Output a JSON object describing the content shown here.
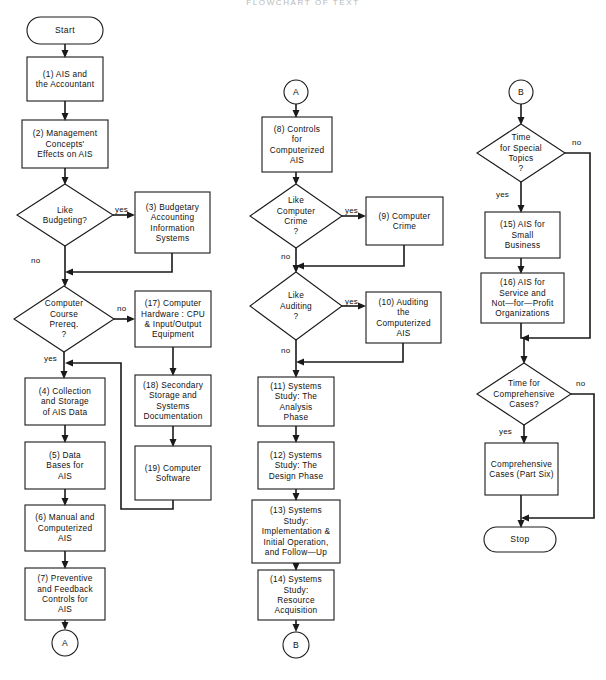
{
  "document": {
    "title_faint": "FLOWCHART OF TEXT",
    "background_color": "#ffffff",
    "ink_color": "#1a1a1a",
    "width": 606,
    "height": 680
  },
  "nodes": {
    "start": {
      "label": "Start",
      "shape": "terminator",
      "x": 27,
      "y": 17,
      "w": 76,
      "h": 27
    },
    "n1": {
      "label": "(1) AIS and\nthe Accountant",
      "shape": "process",
      "x": 27,
      "y": 57,
      "w": 76,
      "h": 44
    },
    "n2": {
      "label": "(2) Management\nConcepts'\nEffects on AIS",
      "shape": "process",
      "x": 22,
      "y": 120,
      "w": 86,
      "h": 48
    },
    "d_budget": {
      "label": "Like\nBudgeting?",
      "shape": "decision",
      "x": 17,
      "y": 184,
      "w": 96,
      "h": 62
    },
    "n3": {
      "label": "(3) Budgetary\nAccounting\nInformation\nSystems",
      "shape": "process",
      "x": 135,
      "y": 192,
      "w": 75,
      "h": 61
    },
    "d_course": {
      "label": "Computer\nCourse\nPrereq.\n?",
      "shape": "decision",
      "x": 14,
      "y": 286,
      "w": 100,
      "h": 66
    },
    "n17": {
      "label": "(17) Computer\nHardware : CPU\n& Input/Output\nEquipment",
      "shape": "process",
      "x": 135,
      "y": 291,
      "w": 76,
      "h": 56
    },
    "n18": {
      "label": "(18) Secondary\nStorage and\nSystems\nDocumentation",
      "shape": "process",
      "x": 135,
      "y": 375,
      "w": 76,
      "h": 51
    },
    "n19": {
      "label": "(19) Computer\nSoftware",
      "shape": "process",
      "x": 135,
      "y": 446,
      "w": 76,
      "h": 54
    },
    "n4": {
      "label": "(4) Collection\nand Storage\nof AIS Data",
      "shape": "process",
      "x": 25,
      "y": 378,
      "w": 80,
      "h": 47
    },
    "n5": {
      "label": "(5) Data\nBases for\nAIS",
      "shape": "process",
      "x": 25,
      "y": 442,
      "w": 80,
      "h": 47
    },
    "n6": {
      "label": "(6) Manual and\nComputerized\nAIS",
      "shape": "process",
      "x": 25,
      "y": 505,
      "w": 80,
      "h": 46
    },
    "n7": {
      "label": "(7) Preventive\nand Feedback\nControls for\nAIS",
      "shape": "process",
      "x": 25,
      "y": 568,
      "w": 80,
      "h": 52
    },
    "conn_a_out": {
      "label": "A",
      "shape": "connector",
      "cx": 65,
      "cy": 643,
      "r": 13
    },
    "conn_a_in": {
      "label": "A",
      "shape": "connector",
      "cx": 296,
      "cy": 92,
      "r": 12
    },
    "n8": {
      "label": "(8) Controls\nfor\nComputerized\nAIS",
      "shape": "process",
      "x": 262,
      "y": 117,
      "w": 70,
      "h": 55
    },
    "d_crime": {
      "label": "Like\nComputer\nCrime\n?",
      "shape": "decision",
      "x": 250,
      "y": 184,
      "w": 92,
      "h": 64
    },
    "n9": {
      "label": "(9) Computer\nCrime",
      "shape": "process",
      "x": 366,
      "y": 197,
      "w": 77,
      "h": 48
    },
    "d_audit": {
      "label": "Like\nAuditing\n?",
      "shape": "decision",
      "x": 250,
      "y": 272,
      "w": 92,
      "h": 68
    },
    "n10": {
      "label": "(10) Auditing\nthe\nComputerized\nAIS",
      "shape": "process",
      "x": 366,
      "y": 292,
      "w": 75,
      "h": 51
    },
    "n11": {
      "label": "(11) Systems\nStudy: The\nAnalysis\nPhase",
      "shape": "process",
      "x": 258,
      "y": 377,
      "w": 76,
      "h": 49
    },
    "n12": {
      "label": "(12) Systems\nStudy: The\nDesign Phase",
      "shape": "process",
      "x": 258,
      "y": 442,
      "w": 76,
      "h": 47
    },
    "n13": {
      "label": "(13) Systems\nStudy:\nImplementation &\nInitial Operation,\nand Follow—Up",
      "shape": "process",
      "x": 252,
      "y": 500,
      "w": 88,
      "h": 63
    },
    "n14": {
      "label": "(14) Systems\nStudy:\nResource\nAcquisition",
      "shape": "process",
      "x": 258,
      "y": 570,
      "w": 76,
      "h": 50
    },
    "conn_b_out": {
      "label": "B",
      "shape": "connector",
      "cx": 296,
      "cy": 645,
      "r": 13
    },
    "conn_b_in": {
      "label": "B",
      "shape": "connector",
      "cx": 521,
      "cy": 92,
      "r": 12
    },
    "d_special": {
      "label": "Time\nfor Special\nTopics\n?",
      "shape": "decision",
      "x": 477,
      "y": 124,
      "w": 88,
      "h": 58
    },
    "n15": {
      "label": "(15) AIS for\nSmall\nBusiness",
      "shape": "process",
      "x": 485,
      "y": 212,
      "w": 75,
      "h": 46
    },
    "n16": {
      "label": "(16) AIS for\nService and\nNot—for—Profit\nOrganizations",
      "shape": "process",
      "x": 481,
      "y": 273,
      "w": 83,
      "h": 50
    },
    "d_cases": {
      "label": "Time for\nComprehensive\nCases?",
      "shape": "decision",
      "x": 477,
      "y": 363,
      "w": 94,
      "h": 62
    },
    "n20": {
      "label": "Comprehensive\nCases (Part Six)",
      "shape": "process",
      "x": 485,
      "y": 443,
      "w": 73,
      "h": 52
    },
    "stop": {
      "label": "Stop",
      "shape": "terminator",
      "x": 484,
      "y": 527,
      "w": 72,
      "h": 25
    }
  },
  "edge_labels": [
    {
      "key": "budget_yes",
      "text": "yes",
      "x": 115,
      "y": 205
    },
    {
      "key": "budget_no",
      "text": "no",
      "x": 31,
      "y": 256
    },
    {
      "key": "course_no",
      "text": "no",
      "x": 117,
      "y": 304
    },
    {
      "key": "course_yes",
      "text": "yes",
      "x": 44,
      "y": 355
    },
    {
      "key": "crime_yes",
      "text": "yes",
      "x": 345,
      "y": 208
    },
    {
      "key": "crime_no",
      "text": "no",
      "x": 281,
      "y": 253
    },
    {
      "key": "audit_yes",
      "text": "yes",
      "x": 345,
      "y": 301
    },
    {
      "key": "audit_no",
      "text": "no",
      "x": 281,
      "y": 348
    },
    {
      "key": "special_no",
      "text": "no",
      "x": 572,
      "y": 137
    },
    {
      "key": "special_yes",
      "text": "yes",
      "x": 497,
      "y": 193
    },
    {
      "key": "cases_no",
      "text": "no",
      "x": 576,
      "y": 376
    },
    {
      "key": "cases_yes",
      "text": "yes",
      "x": 500,
      "y": 428
    }
  ],
  "edges": [
    {
      "from": "start",
      "to": "n1",
      "type": "straight"
    },
    {
      "from": "n1",
      "to": "n2",
      "type": "straight"
    },
    {
      "from": "n2",
      "to": "d_budget",
      "type": "straight"
    },
    {
      "from": "d_budget",
      "to": "n3",
      "type": "branch-right",
      "label": "yes"
    },
    {
      "from": "n3",
      "to": "d_course",
      "type": "loop-back-left",
      "label": ""
    },
    {
      "from": "d_budget",
      "to": "d_course",
      "type": "straight-down",
      "label": "no"
    },
    {
      "from": "d_course",
      "to": "n17",
      "type": "branch-right",
      "label": "no"
    },
    {
      "from": "d_course",
      "to": "n4",
      "type": "straight-down",
      "label": "yes"
    },
    {
      "from": "n17",
      "to": "n18",
      "type": "straight"
    },
    {
      "from": "n18",
      "to": "n19",
      "type": "straight"
    },
    {
      "from": "n19",
      "to": "n4",
      "type": "loop-back-left"
    },
    {
      "from": "n4",
      "to": "n5",
      "type": "straight"
    },
    {
      "from": "n5",
      "to": "n6",
      "type": "straight"
    },
    {
      "from": "n6",
      "to": "n7",
      "type": "straight"
    },
    {
      "from": "n7",
      "to": "conn_a_out",
      "type": "straight"
    },
    {
      "from": "conn_a_in",
      "to": "n8",
      "type": "straight"
    },
    {
      "from": "n8",
      "to": "d_crime",
      "type": "straight"
    },
    {
      "from": "d_crime",
      "to": "n9",
      "type": "branch-right",
      "label": "yes"
    },
    {
      "from": "n9",
      "to": "d_audit",
      "type": "loop-back-left"
    },
    {
      "from": "d_crime",
      "to": "d_audit",
      "type": "straight-down",
      "label": "no"
    },
    {
      "from": "d_audit",
      "to": "n10",
      "type": "branch-right",
      "label": "yes"
    },
    {
      "from": "n10",
      "to": "n11",
      "type": "loop-back-left"
    },
    {
      "from": "d_audit",
      "to": "n11",
      "type": "straight-down",
      "label": "no"
    },
    {
      "from": "n11",
      "to": "n12",
      "type": "straight"
    },
    {
      "from": "n12",
      "to": "n13",
      "type": "straight"
    },
    {
      "from": "n13",
      "to": "n14",
      "type": "straight"
    },
    {
      "from": "n14",
      "to": "conn_b_out",
      "type": "straight"
    },
    {
      "from": "conn_b_in",
      "to": "d_special",
      "type": "straight"
    },
    {
      "from": "d_special",
      "to": "n15",
      "type": "straight-down",
      "label": "yes"
    },
    {
      "from": "d_special",
      "to": "d_cases",
      "type": "bypass-right",
      "label": "no"
    },
    {
      "from": "n15",
      "to": "n16",
      "type": "straight"
    },
    {
      "from": "n16",
      "to": "d_cases",
      "type": "straight"
    },
    {
      "from": "d_cases",
      "to": "n20",
      "type": "straight-down",
      "label": "yes"
    },
    {
      "from": "d_cases",
      "to": "stop",
      "type": "bypass-right",
      "label": "no"
    },
    {
      "from": "n20",
      "to": "stop",
      "type": "straight"
    }
  ]
}
